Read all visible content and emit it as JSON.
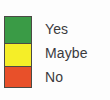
{
  "legend": {
    "title": "",
    "background_color": "#fdfdfd",
    "border_color": "#4a4a45",
    "text_color": "#3b3b3d",
    "items": [
      {
        "label": "Yes",
        "color": "#3a9b46",
        "swatch_name": "green-swatch"
      },
      {
        "label": "Maybe",
        "color": "#f5ee28",
        "swatch_name": "yellow-swatch"
      },
      {
        "label": "No",
        "color": "#e8502a",
        "swatch_name": "red-swatch"
      }
    ]
  }
}
